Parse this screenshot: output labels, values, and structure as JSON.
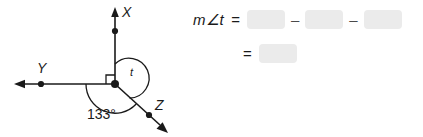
{
  "figure": {
    "vertex_label": "t",
    "ray_labels": {
      "up": "X",
      "left": "Y",
      "lower_right": "Z"
    },
    "angle_measure_label": "133°",
    "right_angle_marker": "right-angle-square",
    "line_color": "#1a1a1a"
  },
  "equation": {
    "line1": {
      "lhs": "m∠t",
      "equals": "=",
      "operator1": "–",
      "operator2": "–",
      "blank1_value": "",
      "blank2_value": "",
      "blank3_value": "",
      "blank_placeholder": ""
    },
    "line2": {
      "equals": "=",
      "blank_value": "",
      "blank_placeholder": ""
    },
    "blank_fill_color": "#ebebeb"
  }
}
